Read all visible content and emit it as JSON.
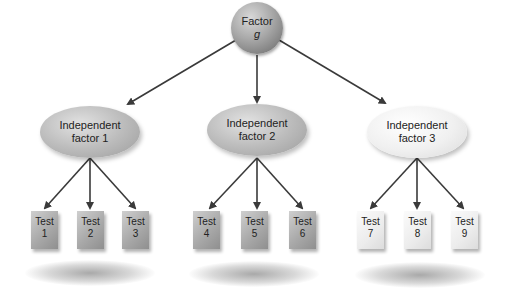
{
  "diagram": {
    "root": {
      "label_line1": "Factor",
      "label_line2": "g"
    },
    "factors": [
      {
        "label_line1": "Independent",
        "label_line2": "factor 1",
        "shade": "dark",
        "tests": [
          {
            "line1": "Test",
            "line2": "1"
          },
          {
            "line1": "Test",
            "line2": "2"
          },
          {
            "line1": "Test",
            "line2": "3"
          }
        ]
      },
      {
        "label_line1": "Independent",
        "label_line2": "factor 2",
        "shade": "dark",
        "tests": [
          {
            "line1": "Test",
            "line2": "4"
          },
          {
            "line1": "Test",
            "line2": "5"
          },
          {
            "line1": "Test",
            "line2": "6"
          }
        ]
      },
      {
        "label_line1": "Independent",
        "label_line2": "factor 3",
        "shade": "light",
        "tests": [
          {
            "line1": "Test",
            "line2": "7"
          },
          {
            "line1": "Test",
            "line2": "8"
          },
          {
            "line1": "Test",
            "line2": "9"
          }
        ]
      }
    ],
    "colors": {
      "arrow": "#3a3a3a",
      "dark_node": "#a9a9a9",
      "light_node": "#efefef",
      "root_node": "#9a9a9a"
    }
  }
}
